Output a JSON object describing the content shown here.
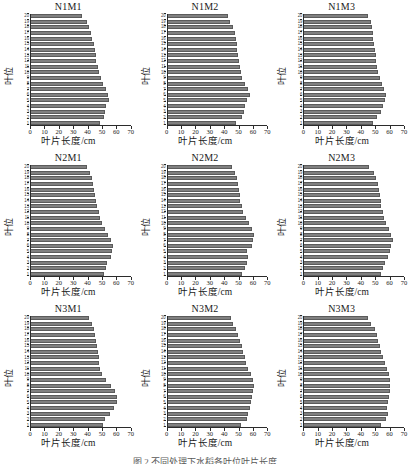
{
  "figure": {
    "rows": 3,
    "cols": 3,
    "bar_color": "#808080",
    "bar_edge_color": "#5b5b5b",
    "caption_partial": "图 2  不同处理下水稻各叶位叶片长度"
  },
  "axis": {
    "x_title": "叶片长度/cm",
    "y_title": "叶位",
    "x_ticks": [
      0,
      10,
      20,
      30,
      40,
      50,
      60,
      70
    ],
    "x_min": 0,
    "x_max": 70,
    "y_ticks": [
      1,
      2,
      3,
      4,
      5,
      6,
      7,
      8,
      9,
      10,
      11,
      12,
      13,
      14,
      15,
      16,
      17,
      18,
      19,
      20
    ],
    "y_min": 1,
    "y_max": 20
  },
  "chart_data": [
    {
      "type": "bar",
      "orientation": "horizontal",
      "title": "N1M1",
      "xlabel": "叶片长度/cm",
      "ylabel": "叶位",
      "xlim": [
        0,
        70
      ],
      "grid": false,
      "categories": [
        1,
        2,
        3,
        4,
        5,
        6,
        7,
        8,
        9,
        10,
        11,
        12,
        13,
        14,
        15,
        16,
        17,
        18,
        19,
        20
      ],
      "values": [
        48.5,
        51.5,
        52.0,
        52.5,
        54.5,
        54.0,
        53.0,
        50.5,
        49.5,
        48.0,
        47.0,
        46.0,
        45.5,
        45.0,
        44.0,
        43.0,
        42.0,
        41.0,
        39.0,
        36.0
      ]
    },
    {
      "type": "bar",
      "orientation": "horizontal",
      "title": "N1M2",
      "xlabel": "叶片长度/cm",
      "ylabel": "叶位",
      "xlim": [
        0,
        70
      ],
      "grid": false,
      "categories": [
        1,
        2,
        3,
        4,
        5,
        6,
        7,
        8,
        9,
        10,
        11,
        12,
        13,
        14,
        15,
        16,
        17,
        18,
        19,
        20
      ],
      "values": [
        48.0,
        52.0,
        53.5,
        54.0,
        56.0,
        57.5,
        56.5,
        54.0,
        52.5,
        51.5,
        50.5,
        50.0,
        49.5,
        49.0,
        48.5,
        48.0,
        47.0,
        46.0,
        44.0,
        42.5
      ]
    },
    {
      "type": "bar",
      "orientation": "horizontal",
      "title": "N1M3",
      "xlabel": "叶片长度/cm",
      "ylabel": "叶位",
      "xlim": [
        0,
        70
      ],
      "grid": false,
      "categories": [
        1,
        2,
        3,
        4,
        5,
        6,
        7,
        8,
        9,
        10,
        11,
        12,
        13,
        14,
        15,
        16,
        17,
        18,
        19,
        20
      ],
      "values": [
        48.5,
        51.0,
        53.5,
        55.0,
        56.5,
        57.5,
        56.0,
        54.5,
        53.0,
        52.0,
        51.0,
        50.5,
        50.0,
        49.5,
        49.0,
        48.5,
        48.0,
        47.5,
        46.5,
        44.5
      ]
    },
    {
      "type": "bar",
      "orientation": "horizontal",
      "title": "N2M1",
      "xlabel": "叶片长度/cm",
      "ylabel": "叶位",
      "xlim": [
        0,
        70
      ],
      "grid": false,
      "categories": [
        1,
        2,
        3,
        4,
        5,
        6,
        7,
        8,
        9,
        10,
        11,
        12,
        13,
        14,
        15,
        16,
        17,
        18,
        19,
        20
      ],
      "values": [
        51.0,
        53.0,
        53.5,
        56.0,
        57.0,
        57.5,
        56.0,
        54.0,
        52.0,
        50.0,
        48.5,
        47.5,
        46.5,
        45.5,
        45.0,
        44.5,
        43.5,
        42.5,
        41.5,
        39.5
      ]
    },
    {
      "type": "bar",
      "orientation": "horizontal",
      "title": "N2M2",
      "xlabel": "叶片长度/cm",
      "ylabel": "叶位",
      "xlim": [
        0,
        70
      ],
      "grid": false,
      "categories": [
        1,
        2,
        3,
        4,
        5,
        6,
        7,
        8,
        9,
        10,
        11,
        12,
        13,
        14,
        15,
        16,
        17,
        18,
        19,
        20
      ],
      "values": [
        52.5,
        54.0,
        55.5,
        56.5,
        56.0,
        59.0,
        60.0,
        60.5,
        59.5,
        57.0,
        55.0,
        53.0,
        52.0,
        51.0,
        50.5,
        50.0,
        49.5,
        49.0,
        47.5,
        45.0
      ]
    },
    {
      "type": "bar",
      "orientation": "horizontal",
      "title": "N2M3",
      "xlabel": "叶片长度/cm",
      "ylabel": "叶位",
      "xlim": [
        0,
        70
      ],
      "grid": false,
      "categories": [
        1,
        2,
        3,
        4,
        5,
        6,
        7,
        8,
        9,
        10,
        11,
        12,
        13,
        14,
        15,
        16,
        17,
        18,
        19,
        20
      ],
      "values": [
        54.0,
        55.5,
        57.0,
        58.5,
        60.0,
        61.0,
        62.0,
        61.0,
        59.5,
        57.5,
        56.0,
        55.0,
        54.0,
        53.5,
        53.0,
        52.5,
        51.5,
        50.5,
        49.0,
        45.5
      ]
    },
    {
      "type": "bar",
      "orientation": "horizontal",
      "title": "N3M1",
      "xlabel": "叶片长度/cm",
      "ylabel": "叶位",
      "xlim": [
        0,
        70
      ],
      "grid": false,
      "categories": [
        1,
        2,
        3,
        4,
        5,
        6,
        7,
        8,
        9,
        10,
        11,
        12,
        13,
        14,
        15,
        16,
        17,
        18,
        19,
        20
      ],
      "values": [
        50.5,
        52.0,
        55.5,
        58.5,
        60.5,
        60.5,
        59.0,
        56.0,
        52.5,
        50.0,
        48.5,
        48.0,
        47.5,
        47.0,
        46.5,
        46.0,
        45.0,
        44.0,
        43.0,
        40.5
      ]
    },
    {
      "type": "bar",
      "orientation": "horizontal",
      "title": "N3M2",
      "xlabel": "叶片长度/cm",
      "ylabel": "叶位",
      "xlim": [
        0,
        70
      ],
      "grid": false,
      "categories": [
        1,
        2,
        3,
        4,
        5,
        6,
        7,
        8,
        9,
        10,
        11,
        12,
        13,
        14,
        15,
        16,
        17,
        18,
        19,
        20
      ],
      "values": [
        51.5,
        55.5,
        56.5,
        57.5,
        58.5,
        59.5,
        60.0,
        60.5,
        60.0,
        58.5,
        56.5,
        55.0,
        54.0,
        53.0,
        52.0,
        51.0,
        49.5,
        48.0,
        46.0,
        44.5
      ]
    },
    {
      "type": "bar",
      "orientation": "horizontal",
      "title": "N3M3",
      "xlabel": "叶片长度/cm",
      "ylabel": "叶位",
      "xlim": [
        0,
        70
      ],
      "grid": false,
      "categories": [
        1,
        2,
        3,
        4,
        5,
        6,
        7,
        8,
        9,
        10,
        11,
        12,
        13,
        14,
        15,
        16,
        17,
        18,
        19,
        20
      ],
      "values": [
        54.0,
        57.5,
        58.5,
        58.0,
        58.5,
        59.5,
        60.0,
        60.5,
        60.5,
        59.5,
        58.0,
        56.5,
        55.0,
        54.0,
        53.0,
        52.0,
        51.0,
        49.5,
        47.0,
        45.0
      ]
    }
  ]
}
